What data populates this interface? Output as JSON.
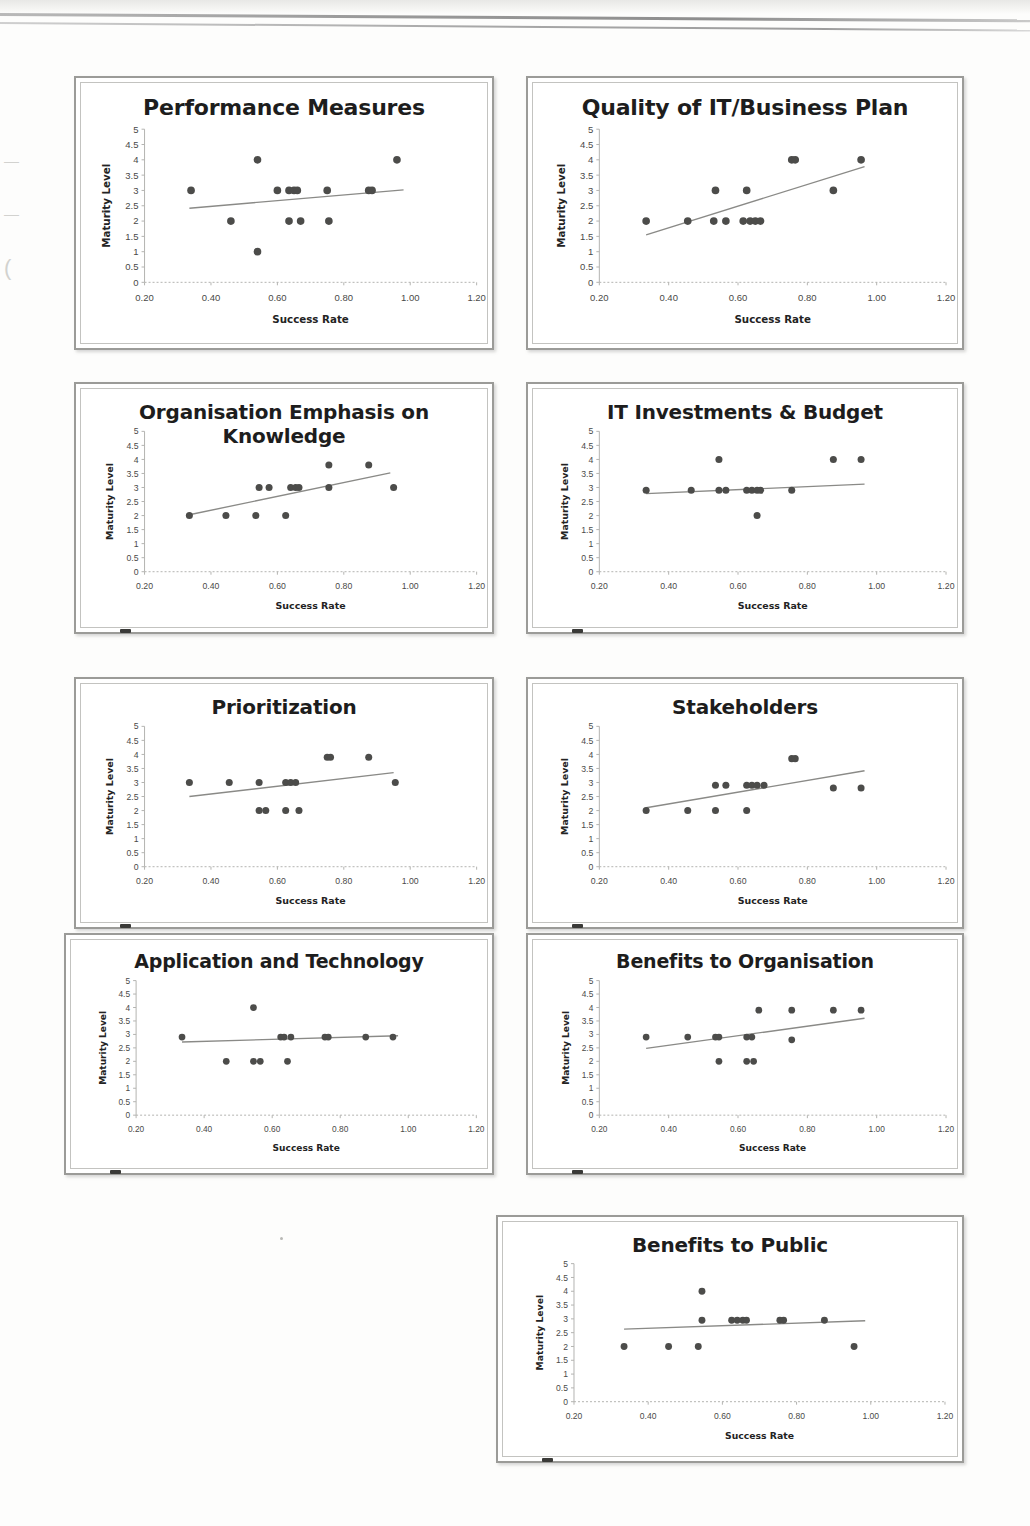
{
  "page": {
    "background_color": "#fdfdfc",
    "scan_artifacts": [
      "top-scanline",
      "left-margin-bleed",
      "panel-corner-smudge"
    ],
    "left_margin_bleed_marks": [
      "←",
      "←",
      "("
    ],
    "stray_dot_label": "·"
  },
  "axes_common": {
    "xlabel": "Success Rate",
    "ylabel": "Maturity Level",
    "xticks": [
      "0.20",
      "0.40",
      "0.60",
      "0.80",
      "1.00",
      "1.20"
    ],
    "xtick_values": [
      0.2,
      0.4,
      0.6,
      0.8,
      1.0,
      1.2
    ],
    "yticks": [
      "0",
      "0.5",
      "1",
      "1.5",
      "2",
      "2.5",
      "3",
      "3.5",
      "4",
      "4.5",
      "5"
    ],
    "ytick_values": [
      0,
      0.5,
      1,
      1.5,
      2,
      2.5,
      3,
      3.5,
      4,
      4.5,
      5
    ],
    "xlim": [
      0.2,
      1.2
    ],
    "ylim": [
      0,
      5
    ],
    "grid": false,
    "legend": "none",
    "marker_color": "#4c4c4a",
    "trendline_color": "#8a8a87"
  },
  "chart_data": [
    {
      "id": "performance-measures",
      "type": "scatter",
      "title": "Performance Measures",
      "xlabel": "Success Rate",
      "ylabel": "Maturity Level",
      "xlim": [
        0.2,
        1.2
      ],
      "ylim": [
        0,
        5
      ],
      "grid": false,
      "points": [
        {
          "x": 0.34,
          "y": 3
        },
        {
          "x": 0.46,
          "y": 2
        },
        {
          "x": 0.54,
          "y": 4
        },
        {
          "x": 0.54,
          "y": 1
        },
        {
          "x": 0.6,
          "y": 3
        },
        {
          "x": 0.635,
          "y": 3
        },
        {
          "x": 0.65,
          "y": 3
        },
        {
          "x": 0.66,
          "y": 3
        },
        {
          "x": 0.635,
          "y": 2
        },
        {
          "x": 0.67,
          "y": 2
        },
        {
          "x": 0.75,
          "y": 3
        },
        {
          "x": 0.755,
          "y": 2
        },
        {
          "x": 0.875,
          "y": 3
        },
        {
          "x": 0.885,
          "y": 3
        },
        {
          "x": 0.96,
          "y": 4
        }
      ],
      "trendline": {
        "x0": 0.335,
        "y0": 2.42,
        "x1": 0.98,
        "y1": 3.02
      }
    },
    {
      "id": "quality-of-it-business-plan",
      "type": "scatter",
      "title": "Quality of IT/Business Plan",
      "xlabel": "Success Rate",
      "ylabel": "Maturity Level",
      "xlim": [
        0.2,
        1.2
      ],
      "ylim": [
        0,
        5
      ],
      "grid": false,
      "points": [
        {
          "x": 0.335,
          "y": 2
        },
        {
          "x": 0.455,
          "y": 2
        },
        {
          "x": 0.535,
          "y": 3
        },
        {
          "x": 0.53,
          "y": 2
        },
        {
          "x": 0.565,
          "y": 2
        },
        {
          "x": 0.625,
          "y": 3
        },
        {
          "x": 0.615,
          "y": 2
        },
        {
          "x": 0.635,
          "y": 2
        },
        {
          "x": 0.65,
          "y": 2
        },
        {
          "x": 0.665,
          "y": 2
        },
        {
          "x": 0.755,
          "y": 4
        },
        {
          "x": 0.765,
          "y": 4
        },
        {
          "x": 0.875,
          "y": 3
        },
        {
          "x": 0.955,
          "y": 4
        }
      ],
      "trendline": {
        "x0": 0.335,
        "y0": 1.55,
        "x1": 0.965,
        "y1": 3.78
      }
    },
    {
      "id": "organisation-emphasis-on-knowledge",
      "type": "scatter",
      "title": "Organisation Emphasis on Knowledge",
      "xlabel": "Success Rate",
      "ylabel": "Maturity Level",
      "xlim": [
        0.2,
        1.2
      ],
      "ylim": [
        0,
        5
      ],
      "grid": false,
      "points": [
        {
          "x": 0.335,
          "y": 2
        },
        {
          "x": 0.445,
          "y": 2
        },
        {
          "x": 0.535,
          "y": 2
        },
        {
          "x": 0.545,
          "y": 3
        },
        {
          "x": 0.575,
          "y": 3
        },
        {
          "x": 0.625,
          "y": 2
        },
        {
          "x": 0.64,
          "y": 3
        },
        {
          "x": 0.655,
          "y": 3
        },
        {
          "x": 0.665,
          "y": 3
        },
        {
          "x": 0.755,
          "y": 3
        },
        {
          "x": 0.755,
          "y": 3.8
        },
        {
          "x": 0.875,
          "y": 3.8
        },
        {
          "x": 0.95,
          "y": 3
        }
      ],
      "trendline": {
        "x0": 0.335,
        "y0": 2.03,
        "x1": 0.94,
        "y1": 3.52
      }
    },
    {
      "id": "it-investments-and-budget",
      "type": "scatter",
      "title": "IT Investments & Budget",
      "xlabel": "Success Rate",
      "ylabel": "Maturity Level",
      "xlim": [
        0.2,
        1.2
      ],
      "ylim": [
        0,
        5
      ],
      "grid": false,
      "points": [
        {
          "x": 0.335,
          "y": 2.9
        },
        {
          "x": 0.465,
          "y": 2.9
        },
        {
          "x": 0.545,
          "y": 4
        },
        {
          "x": 0.545,
          "y": 2.9
        },
        {
          "x": 0.565,
          "y": 2.9
        },
        {
          "x": 0.625,
          "y": 2.9
        },
        {
          "x": 0.64,
          "y": 2.9
        },
        {
          "x": 0.655,
          "y": 2.9
        },
        {
          "x": 0.665,
          "y": 2.9
        },
        {
          "x": 0.655,
          "y": 2
        },
        {
          "x": 0.755,
          "y": 2.9
        },
        {
          "x": 0.875,
          "y": 4
        },
        {
          "x": 0.955,
          "y": 4
        }
      ],
      "trendline": {
        "x0": 0.335,
        "y0": 2.78,
        "x1": 0.965,
        "y1": 3.12
      }
    },
    {
      "id": "prioritization",
      "type": "scatter",
      "title": "Prioritization",
      "xlabel": "Success Rate",
      "ylabel": "Maturity Level",
      "xlim": [
        0.2,
        1.2
      ],
      "ylim": [
        0,
        5
      ],
      "grid": false,
      "points": [
        {
          "x": 0.335,
          "y": 3
        },
        {
          "x": 0.455,
          "y": 3
        },
        {
          "x": 0.545,
          "y": 3
        },
        {
          "x": 0.545,
          "y": 2
        },
        {
          "x": 0.565,
          "y": 2
        },
        {
          "x": 0.625,
          "y": 3
        },
        {
          "x": 0.64,
          "y": 3
        },
        {
          "x": 0.655,
          "y": 3
        },
        {
          "x": 0.625,
          "y": 2
        },
        {
          "x": 0.665,
          "y": 2
        },
        {
          "x": 0.75,
          "y": 3.9
        },
        {
          "x": 0.76,
          "y": 3.9
        },
        {
          "x": 0.875,
          "y": 3.9
        },
        {
          "x": 0.955,
          "y": 3
        }
      ],
      "trendline": {
        "x0": 0.335,
        "y0": 2.5,
        "x1": 0.95,
        "y1": 3.35
      }
    },
    {
      "id": "stakeholders",
      "type": "scatter",
      "title": "Stakeholders",
      "xlabel": "Success Rate",
      "ylabel": "Maturity Level",
      "xlim": [
        0.2,
        1.2
      ],
      "ylim": [
        0,
        5
      ],
      "grid": false,
      "points": [
        {
          "x": 0.335,
          "y": 2
        },
        {
          "x": 0.455,
          "y": 2
        },
        {
          "x": 0.535,
          "y": 2
        },
        {
          "x": 0.535,
          "y": 2.9
        },
        {
          "x": 0.565,
          "y": 2.9
        },
        {
          "x": 0.625,
          "y": 2.9
        },
        {
          "x": 0.64,
          "y": 2.9
        },
        {
          "x": 0.655,
          "y": 2.9
        },
        {
          "x": 0.625,
          "y": 2
        },
        {
          "x": 0.675,
          "y": 2.9
        },
        {
          "x": 0.755,
          "y": 3.85
        },
        {
          "x": 0.765,
          "y": 3.85
        },
        {
          "x": 0.875,
          "y": 2.8
        },
        {
          "x": 0.955,
          "y": 2.8
        }
      ],
      "trendline": {
        "x0": 0.335,
        "y0": 2.1,
        "x1": 0.965,
        "y1": 3.42
      }
    },
    {
      "id": "application-and-technology",
      "type": "scatter",
      "title": "Application and Technology",
      "xlabel": "Success Rate",
      "ylabel": "Maturity Level",
      "xlim": [
        0.2,
        1.2
      ],
      "ylim": [
        0,
        5
      ],
      "grid": false,
      "points": [
        {
          "x": 0.335,
          "y": 2.9
        },
        {
          "x": 0.465,
          "y": 2
        },
        {
          "x": 0.545,
          "y": 4
        },
        {
          "x": 0.545,
          "y": 2
        },
        {
          "x": 0.565,
          "y": 2
        },
        {
          "x": 0.625,
          "y": 2.9
        },
        {
          "x": 0.635,
          "y": 2.9
        },
        {
          "x": 0.655,
          "y": 2.9
        },
        {
          "x": 0.645,
          "y": 2
        },
        {
          "x": 0.755,
          "y": 2.9
        },
        {
          "x": 0.765,
          "y": 2.9
        },
        {
          "x": 0.875,
          "y": 2.9
        },
        {
          "x": 0.955,
          "y": 2.9
        }
      ],
      "trendline": {
        "x0": 0.335,
        "y0": 2.72,
        "x1": 0.97,
        "y1": 2.95
      }
    },
    {
      "id": "benefits-to-organisation",
      "type": "scatter",
      "title": "Benefits to Organisation",
      "xlabel": "Success Rate",
      "ylabel": "Maturity Level",
      "xlim": [
        0.2,
        1.2
      ],
      "ylim": [
        0,
        5
      ],
      "grid": false,
      "points": [
        {
          "x": 0.335,
          "y": 2.9
        },
        {
          "x": 0.455,
          "y": 2.9
        },
        {
          "x": 0.535,
          "y": 2.9
        },
        {
          "x": 0.545,
          "y": 2.9
        },
        {
          "x": 0.545,
          "y": 2
        },
        {
          "x": 0.625,
          "y": 2.9
        },
        {
          "x": 0.64,
          "y": 2.9
        },
        {
          "x": 0.625,
          "y": 2
        },
        {
          "x": 0.645,
          "y": 2
        },
        {
          "x": 0.66,
          "y": 3.9
        },
        {
          "x": 0.755,
          "y": 3.9
        },
        {
          "x": 0.755,
          "y": 2.8
        },
        {
          "x": 0.875,
          "y": 3.9
        },
        {
          "x": 0.955,
          "y": 3.9
        }
      ],
      "trendline": {
        "x0": 0.335,
        "y0": 2.48,
        "x1": 0.965,
        "y1": 3.6
      }
    },
    {
      "id": "benefits-to-public",
      "type": "scatter",
      "title": "Benefits to Public",
      "xlabel": "Success Rate",
      "ylabel": "Maturity Level",
      "xlim": [
        0.2,
        1.2
      ],
      "ylim": [
        0,
        5
      ],
      "grid": false,
      "points": [
        {
          "x": 0.335,
          "y": 2
        },
        {
          "x": 0.455,
          "y": 2
        },
        {
          "x": 0.535,
          "y": 2
        },
        {
          "x": 0.545,
          "y": 4
        },
        {
          "x": 0.545,
          "y": 2.95
        },
        {
          "x": 0.625,
          "y": 2.95
        },
        {
          "x": 0.64,
          "y": 2.95
        },
        {
          "x": 0.655,
          "y": 2.95
        },
        {
          "x": 0.665,
          "y": 2.95
        },
        {
          "x": 0.755,
          "y": 2.95
        },
        {
          "x": 0.765,
          "y": 2.95
        },
        {
          "x": 0.875,
          "y": 2.95
        },
        {
          "x": 0.955,
          "y": 2
        }
      ],
      "trendline": {
        "x0": 0.335,
        "y0": 2.63,
        "x1": 0.985,
        "y1": 2.93
      }
    }
  ]
}
